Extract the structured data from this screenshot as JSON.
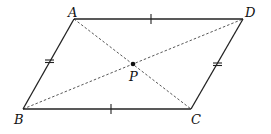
{
  "diagram": {
    "vertices": {
      "A": {
        "label": "A",
        "x": 74,
        "y": 19
      },
      "D": {
        "label": "D",
        "x": 243,
        "y": 19
      },
      "B": {
        "label": "B",
        "x": 23,
        "y": 109
      },
      "C": {
        "label": "C",
        "x": 191,
        "y": 109
      }
    },
    "intersection": {
      "label": "P",
      "x": 133,
      "y": 64
    },
    "edges": [
      {
        "from": "A",
        "to": "D",
        "style": "solid",
        "tick": "single"
      },
      {
        "from": "B",
        "to": "C",
        "style": "solid",
        "tick": "single"
      },
      {
        "from": "A",
        "to": "B",
        "style": "solid",
        "tick": "double"
      },
      {
        "from": "D",
        "to": "C",
        "style": "solid",
        "tick": "double"
      }
    ],
    "diagonals": [
      {
        "from": "A",
        "to": "C",
        "style": "dashed"
      },
      {
        "from": "B",
        "to": "D",
        "style": "dashed"
      }
    ],
    "colors": {
      "stroke": "#222222",
      "background": "#ffffff"
    }
  }
}
